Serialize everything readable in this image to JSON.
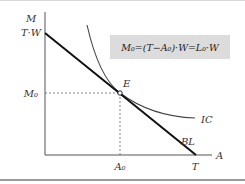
{
  "diagram": {
    "type": "indifference-curve-budget-line",
    "formula": "M₀=(T−A₀)·W=L₀·W",
    "axes": {
      "y_label": "M",
      "x_label": "A",
      "y_intercept_label": "T·W",
      "x_intercept_label": "T"
    },
    "point": {
      "label": "E",
      "x_label": "A₀",
      "y_label": "M₀"
    },
    "curves": [
      {
        "name": "IC",
        "label": "IC",
        "kind": "indifference-curve"
      },
      {
        "name": "BL",
        "label": "BL",
        "kind": "budget-line"
      }
    ],
    "colors": {
      "box_bg": "#dcdcdc",
      "line": "#111111",
      "curve": "#444444",
      "dashed": "#555555"
    }
  }
}
